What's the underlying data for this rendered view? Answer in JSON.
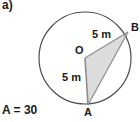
{
  "figure": {
    "part_label": "a)",
    "area_label": "A = 30",
    "background_color": "#ffffff",
    "stroke_color": "#4d4d4d",
    "fill_color": "#dcdcdc",
    "text_color": "#1a1a1a",
    "points": [
      {
        "name": "O",
        "label": "O",
        "role": "center",
        "x": 85,
        "y": 58
      },
      {
        "name": "B",
        "label": "B",
        "role": "on-circle",
        "x": 128,
        "y": 32
      },
      {
        "name": "A",
        "label": "A",
        "role": "on-circle",
        "x": 88,
        "y": 105
      }
    ],
    "circle": {
      "center_x": 85,
      "center_y": 58,
      "radius": 46
    },
    "segments": [
      {
        "name": "OB",
        "from": "O",
        "to": "B",
        "length_label": "5 m"
      },
      {
        "name": "OA",
        "from": "O",
        "to": "A",
        "length_label": "5 m"
      },
      {
        "name": "AB",
        "from": "A",
        "to": "B",
        "length_label": ""
      }
    ],
    "shaded_region": {
      "name": "triangle-OAB",
      "vertices": [
        "O",
        "A",
        "B"
      ]
    },
    "measure_labels": {
      "radius_ob": "5 m",
      "radius_oa": "5 m"
    }
  }
}
